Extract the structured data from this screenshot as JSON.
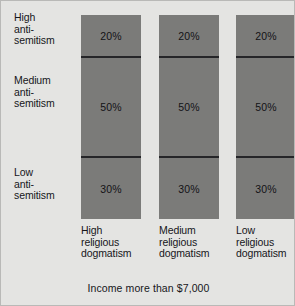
{
  "chart_data": {
    "type": "bar",
    "subtype": "stacked-100-percent",
    "orientation": "vertical",
    "title": "",
    "caption": "Income more than $7,000",
    "xlabel": "",
    "ylabel": "",
    "categories": [
      "High religious dogmatism",
      "Medium religious dogmatism",
      "Low religious dogmatism"
    ],
    "category_lines": [
      [
        "High",
        "religious",
        "dogmatism"
      ],
      [
        "Medium",
        "religious",
        "dogmatism"
      ],
      [
        "Low",
        "religious",
        "dogmatism"
      ]
    ],
    "stack_labels": [
      "High anti-semitism",
      "Medium anti-semitism",
      "Low anti-semitism"
    ],
    "stack_label_lines": [
      [
        "High",
        "anti-",
        "semitism"
      ],
      [
        "Medium",
        "anti-",
        "semitism"
      ],
      [
        "Low",
        "anti-",
        "semitism"
      ]
    ],
    "series": [
      {
        "name": "High anti-semitism",
        "values": [
          20,
          50,
          30
        ]
      },
      {
        "name": "Medium anti-semitism",
        "values": [
          20,
          50,
          30
        ]
      },
      {
        "name": "Low anti-semitism",
        "values": [
          20,
          50,
          30
        ]
      }
    ],
    "bars": [
      {
        "category": "High religious dogmatism",
        "segments": [
          {
            "label": "High anti-semitism",
            "value": 20,
            "display": "20%"
          },
          {
            "label": "Medium anti-semitism",
            "value": 50,
            "display": "50%"
          },
          {
            "label": "Low anti-semitism",
            "value": 30,
            "display": "30%"
          }
        ]
      },
      {
        "category": "Medium religious dogmatism",
        "segments": [
          {
            "label": "High anti-semitism",
            "value": 20,
            "display": "20%"
          },
          {
            "label": "Medium anti-semitism",
            "value": 50,
            "display": "50%"
          },
          {
            "label": "Low anti-semitism",
            "value": 30,
            "display": "30%"
          }
        ]
      },
      {
        "category": "Low religious dogmatism",
        "segments": [
          {
            "label": "High anti-semitism",
            "value": 20,
            "display": "20%"
          },
          {
            "label": "Medium anti-semitism",
            "value": 50,
            "display": "50%"
          },
          {
            "label": "Low anti-semitism",
            "value": 30,
            "display": "30%"
          }
        ]
      }
    ],
    "ylim": [
      0,
      100
    ],
    "grid": false,
    "legend": "none",
    "units": "percent",
    "colors": {
      "background": "#e4e4e2",
      "bar_fill": "#7b7b79",
      "divider": "#252528",
      "text": "#16161a",
      "border": "#b9b9b7"
    }
  }
}
